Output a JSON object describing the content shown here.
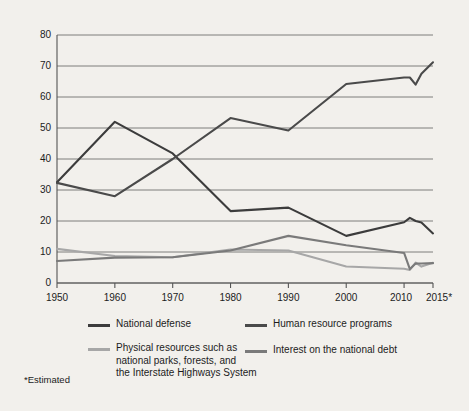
{
  "chart_data": {
    "type": "line",
    "title": "",
    "xlabel": "",
    "ylabel": "Percent of Federal Budget",
    "footnote": "*Estimated",
    "xlim": [
      1950,
      2015
    ],
    "ylim": [
      0,
      80
    ],
    "yticks": [
      0,
      10,
      20,
      30,
      40,
      50,
      60,
      70,
      80
    ],
    "xticks": [
      "1950",
      "1960",
      "1970",
      "1980",
      "1990",
      "2000",
      "2010",
      "2015*"
    ],
    "xtick_values": [
      1950,
      1960,
      1970,
      1980,
      1990,
      2000,
      2010,
      2015
    ],
    "grid": "horizontal",
    "legend_position": "below",
    "series": [
      {
        "name": "National defense",
        "color": "#3c3c3c",
        "x": [
          1950,
          1960,
          1970,
          1980,
          1990,
          2000,
          2010,
          2011,
          2012,
          2013,
          2015
        ],
        "values": [
          32.5,
          52.0,
          41.8,
          23.2,
          24.3,
          15.2,
          19.6,
          21.0,
          20.0,
          19.5,
          16.0
        ]
      },
      {
        "name": "Human resource programs",
        "color": "#4a4a4a",
        "x": [
          1950,
          1960,
          1970,
          1980,
          1990,
          2000,
          2010,
          2011,
          2012,
          2013,
          2015
        ],
        "values": [
          32.3,
          28.0,
          40.0,
          53.2,
          49.2,
          64.2,
          66.3,
          66.3,
          64.0,
          67.5,
          71.2
        ]
      },
      {
        "name": "Physical resources such as national parks, forests, and the Interstate Highways System",
        "color": "#a7a7a7",
        "x": [
          1950,
          1960,
          1970,
          1980,
          1990,
          2000,
          2010,
          2011,
          2012,
          2013,
          2015
        ],
        "values": [
          11.0,
          8.7,
          8.3,
          10.8,
          10.5,
          5.3,
          4.6,
          4.2,
          6.6,
          5.3,
          6.5
        ]
      },
      {
        "name": "Interest on the national debt",
        "color": "#7a7a7a",
        "x": [
          1950,
          1960,
          1970,
          1980,
          1990,
          2000,
          2010,
          2011,
          2012,
          2013,
          2015
        ],
        "values": [
          7.1,
          8.2,
          8.3,
          10.5,
          15.2,
          12.2,
          9.7,
          4.5,
          6.3,
          6.3,
          6.4
        ]
      }
    ]
  },
  "legend": {
    "entries": [
      {
        "label": "National defense",
        "color": "#3c3c3c"
      },
      {
        "label": "Human resource programs",
        "color": "#4a4a4a"
      },
      {
        "label": "Physical resources such as",
        "label2": "national parks, forests, and",
        "label3": "the Interstate Highways System",
        "color": "#a7a7a7"
      },
      {
        "label": "Interest on the national debt",
        "color": "#7a7a7a"
      }
    ]
  },
  "axis": {
    "ylabel": "Percent of Federal Budget",
    "yticks": [
      "80",
      "70",
      "60",
      "50",
      "40",
      "30",
      "20",
      "10",
      "0"
    ],
    "xticks": [
      "1950",
      "1960",
      "1970",
      "1980",
      "1990",
      "2000",
      "2010",
      "2015*"
    ]
  },
  "footnote": "*Estimated",
  "colors": {
    "background": "#f2f0ec",
    "axis": "#555555",
    "grid": "#6f6f6f",
    "text": "#1c1c1c"
  }
}
